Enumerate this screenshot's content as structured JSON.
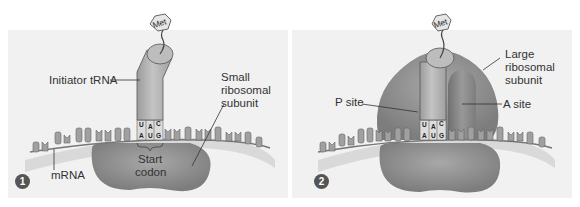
{
  "figure": {
    "panels": [
      {
        "step": "1",
        "amino_acid": "Met",
        "labels": {
          "trna": "Initiator tRNA",
          "small_subunit": [
            "Small",
            "ribosomal",
            "subunit"
          ],
          "mrna": "mRNA",
          "start_codon": [
            "Start",
            "codon"
          ]
        },
        "anticodon": [
          "U",
          "A",
          "C"
        ],
        "codon": [
          "A",
          "U",
          "G"
        ]
      },
      {
        "step": "2",
        "amino_acid": "Met",
        "labels": {
          "large_subunit": [
            "Large",
            "ribosomal",
            "subunit"
          ],
          "p_site": "P site",
          "a_site": "A site"
        },
        "anticodon": [
          "U",
          "A",
          "C"
        ],
        "codon": [
          "A",
          "U",
          "G"
        ]
      }
    ],
    "colors": {
      "background": "#f1f1f1",
      "ribosome": "#8f8f8f",
      "trna": "#b5b5b5",
      "mrna_strip": "#d6d6d6",
      "badge": "#555555"
    }
  }
}
